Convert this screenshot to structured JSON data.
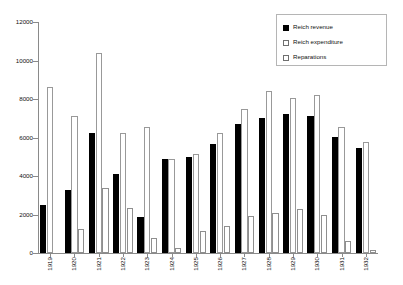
{
  "chart_data": {
    "type": "bar",
    "title": "",
    "subtitle": "",
    "xlabel": "",
    "ylabel": "",
    "categories": [
      "1919",
      "1920",
      "1921",
      "1922",
      "1923",
      "1924",
      "1925",
      "1926",
      "1927",
      "1928",
      "1929",
      "1930",
      "1931",
      "1932"
    ],
    "series": [
      {
        "name": "Reich revenue",
        "style": "solid-black",
        "color": "#000000",
        "values": [
          2500,
          3250,
          6250,
          4100,
          1850,
          4900,
          5000,
          5650,
          6700,
          7000,
          7200,
          7100,
          6050,
          5450
        ]
      },
      {
        "name": "Reich expenditure",
        "style": "open-white",
        "color": "#ffffff",
        "values": [
          8650,
          7100,
          10400,
          6250,
          6550,
          4900,
          5150,
          6250,
          7500,
          8400,
          8050,
          8200,
          6550,
          5750
        ]
      },
      {
        "name": "Reparations",
        "style": "cross-hatch-gray",
        "color": "#8a8a8a",
        "values": [
          0,
          1250,
          3400,
          2350,
          800,
          280,
          1150,
          1400,
          1900,
          2100,
          2300,
          2000,
          600,
          150
        ]
      }
    ],
    "ylim": [
      0,
      12000
    ],
    "y_ticks": [
      0,
      2000,
      4000,
      6000,
      8000,
      10000,
      12000
    ],
    "y_tick_labels": [
      "0",
      "2000",
      "4000",
      "6000",
      "8000",
      "10000",
      "12000"
    ],
    "grid": false,
    "legend_position": "top-right",
    "legend_entries": [
      "Reich revenue",
      "Reich expenditure",
      "Reparations"
    ]
  },
  "axis_colors": {
    "axis_line": "#8a8a8a",
    "legend_border": "#b5b5b5",
    "text": "#111111"
  }
}
